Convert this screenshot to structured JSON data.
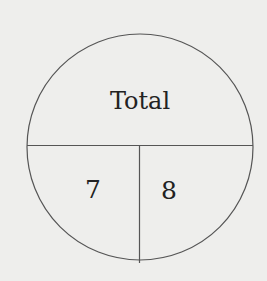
{
  "diagram": {
    "type": "number-bond-circle",
    "top_label": "Total",
    "bottom_left_value": "7",
    "bottom_right_value": "8",
    "colors": {
      "background": "#eeeeec",
      "stroke": "#555555",
      "text": "#222222"
    }
  }
}
